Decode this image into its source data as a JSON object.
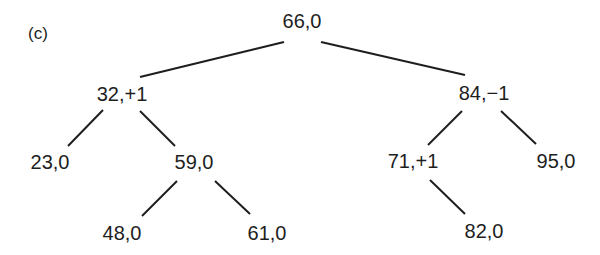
{
  "figure": {
    "label": "(c)",
    "edge_color": "#1e1e1e"
  },
  "tree": {
    "root": {
      "label": "66,0",
      "key": 66,
      "balance": "0",
      "x": 302,
      "y": 21
    },
    "n32": {
      "label": "32,+1",
      "key": 32,
      "balance": "+1",
      "x": 122,
      "y": 94
    },
    "n84": {
      "label": "84,−1",
      "key": 84,
      "balance": "−1",
      "x": 484,
      "y": 93
    },
    "n23": {
      "label": "23,0",
      "key": 23,
      "balance": "0",
      "x": 50,
      "y": 162
    },
    "n59": {
      "label": "59,0",
      "key": 59,
      "balance": "0",
      "x": 194,
      "y": 162
    },
    "n71": {
      "label": "71,+1",
      "key": 71,
      "balance": "+1",
      "x": 413,
      "y": 161
    },
    "n95": {
      "label": "95,0",
      "key": 95,
      "balance": "0",
      "x": 556,
      "y": 161
    },
    "n48": {
      "label": "48,0",
      "key": 48,
      "balance": "0",
      "x": 122,
      "y": 233
    },
    "n61": {
      "label": "61,0",
      "key": 61,
      "balance": "0",
      "x": 267,
      "y": 233
    },
    "n82": {
      "label": "82,0",
      "key": 82,
      "balance": "0",
      "x": 484,
      "y": 231
    }
  },
  "edges": [
    {
      "from": "66",
      "to": "32"
    },
    {
      "from": "66",
      "to": "84"
    },
    {
      "from": "32",
      "to": "23"
    },
    {
      "from": "32",
      "to": "59"
    },
    {
      "from": "59",
      "to": "48"
    },
    {
      "from": "59",
      "to": "61"
    },
    {
      "from": "84",
      "to": "71"
    },
    {
      "from": "84",
      "to": "95"
    },
    {
      "from": "71",
      "to": "82"
    }
  ]
}
